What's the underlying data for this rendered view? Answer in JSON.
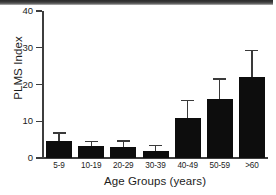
{
  "chart_data": {
    "type": "bar",
    "title": "",
    "subtitle": "",
    "xlabel": "Age Groups (years)",
    "ylabel": "PLMS Index",
    "categories": [
      "5-9",
      "10-19",
      "20-29",
      "30-39",
      "40-49",
      "50-59",
      ">60"
    ],
    "values": [
      4.5,
      3.3,
      2.9,
      2.0,
      11.0,
      16.0,
      22.0
    ],
    "error_upper": [
      7.0,
      4.6,
      4.8,
      3.5,
      15.8,
      21.7,
      29.5
    ],
    "series": [
      {
        "name": "PLMS Index",
        "values": [
          4.5,
          3.3,
          2.9,
          2.0,
          11.0,
          16.0,
          22.0
        ],
        "error_upper": [
          7.0,
          4.6,
          4.8,
          3.5,
          15.8,
          21.7,
          29.5
        ]
      }
    ],
    "ylim": [
      0,
      40
    ],
    "yticks": [
      0,
      10,
      20,
      30,
      40
    ],
    "ytick_labels": [
      "0",
      "10",
      "20",
      "30",
      "40"
    ],
    "grid": false,
    "legend": null,
    "errorbar_direction": "upper-only",
    "bar_color": "#0d0d0d",
    "axis_color": "#3d3d3d",
    "background": "#ffffff"
  },
  "axes": {
    "y_title": "PLMS Index",
    "x_title": "Age Groups (years)"
  }
}
